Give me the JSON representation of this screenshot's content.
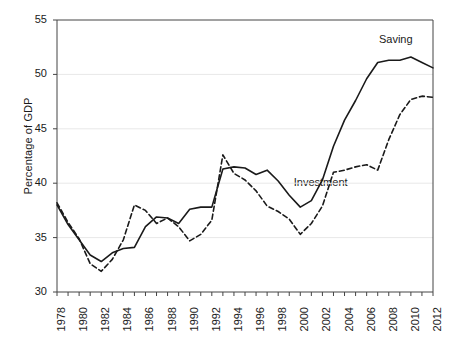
{
  "chart_data": {
    "type": "line",
    "title": "",
    "xlabel": "",
    "ylabel": "Percentage of GDP",
    "xlim": [
      1978,
      2012
    ],
    "ylim": [
      30,
      55
    ],
    "ytick_labels": [
      "30",
      "35",
      "40",
      "45",
      "50",
      "55"
    ],
    "ytick_values": [
      30,
      35,
      40,
      45,
      50,
      55
    ],
    "xtick_labels": [
      "1978",
      "1980",
      "1982",
      "1984",
      "1986",
      "1988",
      "1990",
      "1992",
      "1994",
      "1996",
      "1998",
      "2000",
      "2002",
      "2004",
      "2006",
      "2008",
      "2010",
      "2012"
    ],
    "xtick_values": [
      1978,
      1980,
      1982,
      1984,
      1986,
      1988,
      1990,
      1992,
      1994,
      1996,
      1998,
      2000,
      2002,
      2004,
      2006,
      2008,
      2010,
      2012
    ],
    "minor_xticks": [
      1979,
      1981,
      1983,
      1985,
      1987,
      1989,
      1991,
      1993,
      1995,
      1997,
      1999,
      2001,
      2003,
      2005,
      2007,
      2009,
      2011
    ],
    "grid": "horizontal",
    "grid_color": "#e8e8e8",
    "legend_position": "inline-annotation",
    "x": [
      1978,
      1979,
      1980,
      1981,
      1982,
      1983,
      1984,
      1985,
      1986,
      1987,
      1988,
      1989,
      1990,
      1991,
      1992,
      1993,
      1994,
      1995,
      1996,
      1997,
      1998,
      1999,
      2000,
      2001,
      2002,
      2003,
      2004,
      2005,
      2006,
      2007,
      2008,
      2009,
      2010,
      2011,
      2012
    ],
    "series": [
      {
        "name": "Saving",
        "style": "solid",
        "color": "#1a1a1a",
        "label_x": 2009.1,
        "label_y": 53.2,
        "values": [
          38.0,
          36.2,
          34.8,
          33.4,
          32.8,
          33.6,
          34.0,
          34.1,
          36.0,
          36.9,
          36.8,
          36.3,
          37.6,
          37.8,
          37.8,
          41.3,
          41.5,
          41.4,
          40.8,
          41.2,
          40.2,
          38.9,
          37.8,
          38.4,
          40.3,
          43.4,
          45.8,
          47.6,
          49.6,
          51.1,
          51.3,
          51.3,
          51.6,
          51.1,
          50.6
        ]
      },
      {
        "name": "Investment",
        "style": "dashed",
        "color": "#1a1a1a",
        "label_x": 2001.4,
        "label_y": 40.0,
        "values": [
          38.2,
          36.4,
          34.9,
          32.6,
          31.9,
          33.0,
          34.8,
          38.0,
          37.5,
          36.3,
          36.8,
          36.0,
          34.7,
          35.3,
          36.6,
          42.6,
          40.9,
          40.3,
          39.3,
          37.9,
          37.4,
          36.7,
          35.3,
          36.3,
          37.9,
          41.0,
          41.2,
          41.5,
          41.7,
          41.2,
          44.0,
          46.3,
          47.7,
          48.0,
          47.9
        ]
      }
    ]
  }
}
